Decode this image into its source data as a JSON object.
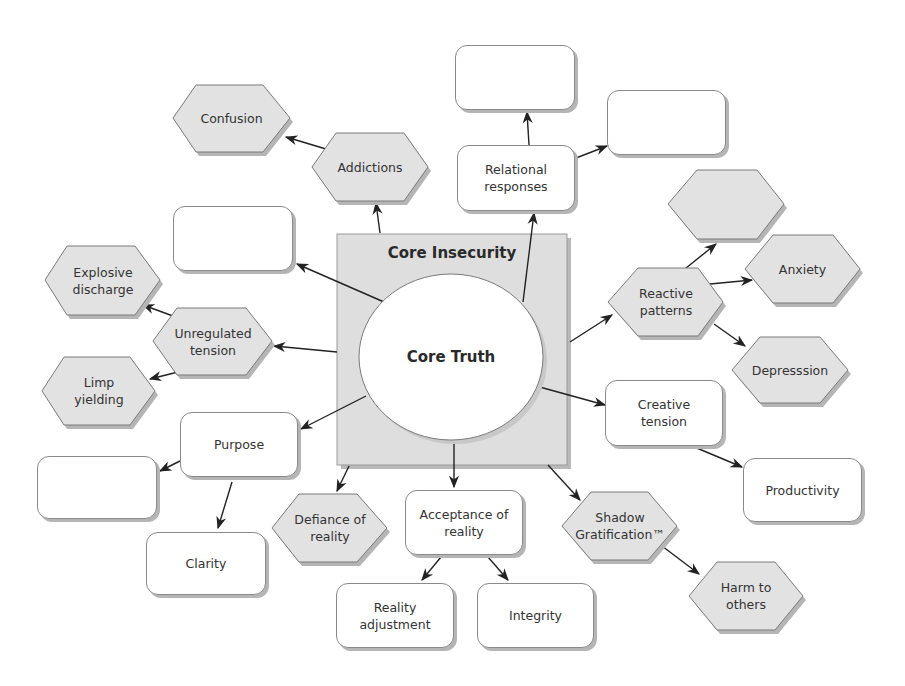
{
  "diagram": {
    "center": {
      "outer_label": "Core Insecurity",
      "inner_label": "Core Truth"
    },
    "nodes": {
      "addictions": "Addictions",
      "confusion": "Confusion",
      "relational_responses": "Relational responses",
      "empty_top": "",
      "empty_top_right": "",
      "empty_left_upper": "",
      "unregulated_tension": "Unregulated tension",
      "explosive_discharge": "Explosive discharge",
      "limp_yielding": "Limp yielding",
      "reactive_patterns": "Reactive patterns",
      "empty_hex_right": "",
      "anxiety": "Anxiety",
      "depression": "Depresssion",
      "purpose": "Purpose",
      "empty_left_lower": "",
      "clarity": "Clarity",
      "defiance_of_reality": "Defiance of reality",
      "acceptance_of_reality": "Acceptance of reality",
      "reality_adjustment": "Reality adjustment",
      "integrity": "Integrity",
      "creative_tension": "Creative tension",
      "productivity": "Productivity",
      "shadow_gratification": "Shadow Gratification™",
      "harm_to_others": "Harm to others"
    },
    "colors": {
      "hex_fill": "#e2e2e2",
      "square_fill": "#dedede",
      "box_fill": "#ffffff",
      "stroke": "#6e6e6e",
      "arrow": "#222222"
    }
  }
}
